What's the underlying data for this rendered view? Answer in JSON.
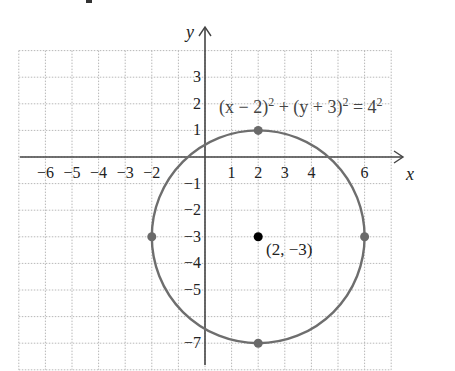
{
  "figure": {
    "type": "circle-graph",
    "equation": {
      "h": "2",
      "k": "3",
      "r": "4",
      "text_x": "(x − 2)",
      "text_plus": " + ",
      "text_y": "(y + 3)",
      "text_eq": " = 4",
      "sup": "2"
    },
    "center_label": "(2, −3)",
    "axis_labels": {
      "x": "x",
      "y": "y"
    },
    "x_ticks": [
      {
        "v": -6,
        "label": "−6"
      },
      {
        "v": -5,
        "label": "−5"
      },
      {
        "v": -4,
        "label": "−4"
      },
      {
        "v": -3,
        "label": "−3"
      },
      {
        "v": -2,
        "label": "−2"
      },
      {
        "v": 1,
        "label": "1"
      },
      {
        "v": 2,
        "label": "2"
      },
      {
        "v": 3,
        "label": "3"
      },
      {
        "v": 4,
        "label": "4"
      },
      {
        "v": 6,
        "label": "6"
      }
    ],
    "y_ticks": [
      {
        "v": 3,
        "label": "3"
      },
      {
        "v": 2,
        "label": "2"
      },
      {
        "v": 1,
        "label": "1"
      },
      {
        "v": -1,
        "label": "−1"
      },
      {
        "v": -2,
        "label": "−2"
      },
      {
        "v": -3,
        "label": "−3"
      },
      {
        "v": -4,
        "label": "−4"
      },
      {
        "v": -5,
        "label": "−5"
      },
      {
        "v": -7,
        "label": "−7"
      }
    ],
    "center": {
      "x": 2,
      "y": -3
    },
    "radius": 4,
    "marked_points": [
      {
        "x": 2,
        "y": 1
      },
      {
        "x": -2,
        "y": -3
      },
      {
        "x": 6,
        "y": -3
      },
      {
        "x": 2,
        "y": -7
      }
    ],
    "grid": {
      "xmin": -7,
      "xmax": 7,
      "ymin": -8,
      "ymax": 4
    },
    "colors": {
      "circle": "#6e6e6e",
      "axis": "#444444",
      "grid": "#b8b8b8",
      "point": "#6a6a6a",
      "center": "#000000"
    }
  }
}
